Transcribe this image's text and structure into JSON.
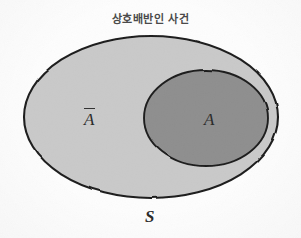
{
  "figure": {
    "title": "상호배반인 사건",
    "background_color": "#fdfdfd",
    "labels": {
      "universe": "S",
      "event": "A",
      "complement": "A",
      "complement_has_overline": true
    },
    "regions": [
      {
        "id": "sample-space",
        "name": "sample-space-ellipse",
        "label": "S",
        "fill": "#c9c9c9",
        "stroke": "#1c1c1c",
        "cx": 151,
        "cy": 117,
        "rx": 127,
        "ry": 81
      },
      {
        "id": "event-a",
        "name": "event-a-ellipse",
        "label": "A",
        "fill": "#8e8e8e",
        "stroke": "#1c1c1c",
        "cx": 206,
        "cy": 118,
        "rx": 62,
        "ry": 48
      }
    ],
    "colors": {
      "outer_fill": "#c9c9c9",
      "inner_fill": "#8e8e8e",
      "outline": "#1c1c1c",
      "text": "#2b2b2b",
      "title_text": "#4a4a4a"
    }
  }
}
